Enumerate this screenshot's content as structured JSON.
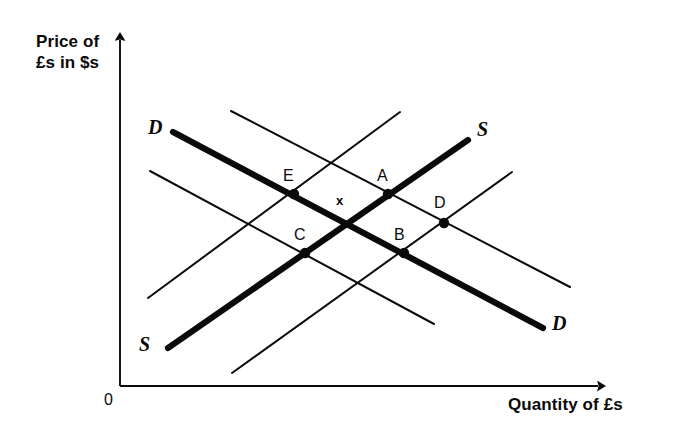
{
  "figure": {
    "background_color": "#ffffff",
    "ink_color": "#0a0a0a"
  },
  "axes": {
    "y_label": "Price of\n£s in $s",
    "x_label": "Quantity of £s",
    "origin_label": "0",
    "y_axis_name": "price-axis",
    "x_axis_name": "quantity-axis"
  },
  "curve_labels": {
    "demand_top_left": "D",
    "demand_bottom_right": "D",
    "supply_top_right": "S",
    "supply_bottom_left": "S"
  },
  "points": [
    {
      "id": "E",
      "label": "E",
      "x": 294,
      "y": 194,
      "label_x": 283,
      "label_y": 167
    },
    {
      "id": "A",
      "label": "A",
      "x": 388,
      "y": 194,
      "label_x": 377,
      "label_y": 167
    },
    {
      "id": "D",
      "label": "D",
      "x": 444,
      "y": 223,
      "label_x": 434,
      "label_y": 194
    },
    {
      "id": "C",
      "label": "C",
      "x": 305,
      "y": 253,
      "label_x": 294,
      "label_y": 226
    },
    {
      "id": "B",
      "label": "B",
      "x": 404,
      "y": 253,
      "label_x": 394,
      "label_y": 226
    }
  ],
  "center_marker": {
    "symbol": "x",
    "x": 341,
    "y": 200
  },
  "chart_data": {
    "type": "line",
    "title": "",
    "xlabel": "Quantity of £s",
    "ylabel": "Price of £s in $s",
    "grid": false,
    "legend": "none",
    "note": "Foreign-exchange market diagram: three parallel downward-sloping demand curves for pounds and three parallel upward-sloping supply curves of pounds; the bold pair is the reference D and S. Labelled intersection points E, A, C, B and D surround the bold-curve equilibrium marked x.",
    "series": [
      {
        "name": "D (bold demand)",
        "role": "demand",
        "weight": "bold",
        "x": [
          173,
          543
        ],
        "y": [
          132,
          328
        ]
      },
      {
        "name": "D (thin demand, shifted left)",
        "role": "demand",
        "weight": "thin",
        "x": [
          150,
          434
        ],
        "y": [
          171,
          324
        ]
      },
      {
        "name": "D (thin demand, shifted right)",
        "role": "demand",
        "weight": "thin",
        "x": [
          231,
          570
        ],
        "y": [
          111,
          287
        ]
      },
      {
        "name": "S (bold supply)",
        "role": "supply",
        "weight": "bold",
        "x": [
          168,
          468
        ],
        "y": [
          348,
          140
        ]
      },
      {
        "name": "S (thin supply, shifted left)",
        "role": "supply",
        "weight": "thin",
        "x": [
          148,
          400
        ],
        "y": [
          298,
          112
        ]
      },
      {
        "name": "S (thin supply, shifted right)",
        "role": "supply",
        "weight": "thin",
        "x": [
          232,
          512
        ],
        "y": [
          373,
          172
        ]
      }
    ],
    "labelled_points": [
      {
        "name": "E",
        "x": 294,
        "y": 194
      },
      {
        "name": "A",
        "x": 388,
        "y": 194
      },
      {
        "name": "D",
        "x": 444,
        "y": 223
      },
      {
        "name": "C",
        "x": 305,
        "y": 253
      },
      {
        "name": "B",
        "x": 404,
        "y": 253
      },
      {
        "name": "x",
        "x": 341,
        "y": 200
      }
    ]
  }
}
